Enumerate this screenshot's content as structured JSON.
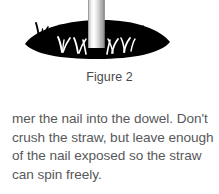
{
  "page": {
    "background_color": "#ffffff",
    "width": 219,
    "height": 194
  },
  "figure": {
    "caption": "Figure 2",
    "alt_description": "Cutaway illustration of a dowel in the ground with a straw standing upright in it, surrounded by grass",
    "colors": {
      "ground": "#000000",
      "straw_light": "#ffffff",
      "straw_mid": "#d0d0d0",
      "straw_dark": "#8e8e8e",
      "straw_edge": "#a8a8a8",
      "grass_dark": "#000000",
      "grass_light": "#ffffff"
    },
    "elements": {
      "ground_mound": "ground-mound-shape",
      "straw_cylinder": "straw-cylinder-shape",
      "grass_tufts_above": "grass-tuft-dark",
      "grass_tufts_inside": "grass-tuft-light"
    }
  },
  "body": {
    "lines": [
      "mer the nail into the dowel. Don't",
      "crush the straw, but leave enough",
      "of the nail exposed so the straw",
      "can spin freely."
    ]
  }
}
